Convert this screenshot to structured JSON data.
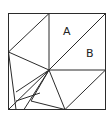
{
  "diagram": {
    "type": "geometric-dissection",
    "labels": [
      {
        "id": "A",
        "text": "A",
        "x": 63,
        "y": 35
      },
      {
        "id": "B",
        "text": "B",
        "x": 86,
        "y": 57
      }
    ],
    "colors": {
      "stroke": "#2b2b2b",
      "background": "#ffffff",
      "text": "#222222"
    }
  }
}
